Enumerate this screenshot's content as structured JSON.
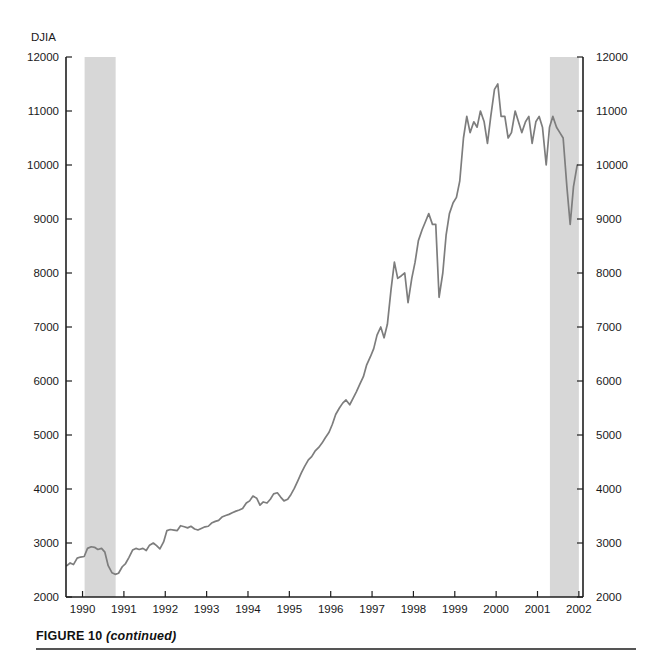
{
  "caption": {
    "label": "FIGURE 10",
    "note": "(continued)"
  },
  "chart_data": {
    "type": "line",
    "title": "",
    "subtitle": "",
    "xlabel": "",
    "ylabel": "DJIA",
    "ylabel_position": "top-left",
    "ylim": [
      2000,
      12000
    ],
    "xlim": [
      1989.6,
      2002.1
    ],
    "grid": false,
    "legend": null,
    "y_ticks": [
      2000,
      3000,
      4000,
      5000,
      6000,
      7000,
      8000,
      9000,
      10000,
      11000,
      12000
    ],
    "y_tick_labels": [
      "2000",
      "3000",
      "4000",
      "5000",
      "6000",
      "7000",
      "8000",
      "9000",
      "10000",
      "11000",
      "12000"
    ],
    "y_axis_right_ticks": [
      2000,
      3000,
      4000,
      5000,
      6000,
      7000,
      8000,
      9000,
      10000,
      11000,
      12000
    ],
    "y_axis_right_labels": [
      "2000",
      "3000",
      "4000",
      "5000",
      "6000",
      "7000",
      "8000",
      "9000",
      "10000",
      "11000",
      "12000"
    ],
    "x_ticks": [
      1990,
      1991,
      1992,
      1993,
      1994,
      1995,
      1996,
      1997,
      1998,
      1999,
      2000,
      2001,
      2002
    ],
    "x_tick_labels": [
      "1990",
      "1991",
      "1992",
      "1993",
      "1994",
      "1995",
      "1996",
      "1997",
      "1998",
      "1999",
      "2000",
      "2001",
      "2002"
    ],
    "line_color": "#7d7d7d",
    "band_color": "#d7d7d7",
    "axis_color": "#1f1f1f",
    "shaded_regions": [
      {
        "name": "recession-1990-1991",
        "start": 1990.05,
        "end": 1990.8
      },
      {
        "name": "recession-2001",
        "start": 2001.3,
        "end": 2002.0
      }
    ],
    "series": [
      {
        "name": "DJIA",
        "x": [
          1989.62,
          1989.7,
          1989.78,
          1989.87,
          1989.95,
          1990.04,
          1990.12,
          1990.21,
          1990.29,
          1990.37,
          1990.46,
          1990.54,
          1990.62,
          1990.71,
          1990.79,
          1990.87,
          1990.96,
          1991.04,
          1991.12,
          1991.21,
          1991.29,
          1991.37,
          1991.46,
          1991.54,
          1991.62,
          1991.71,
          1991.79,
          1991.87,
          1991.96,
          1992.04,
          1992.12,
          1992.21,
          1992.29,
          1992.37,
          1992.46,
          1992.54,
          1992.62,
          1992.71,
          1992.79,
          1992.87,
          1992.96,
          1993.04,
          1993.12,
          1993.21,
          1993.29,
          1993.37,
          1993.46,
          1993.54,
          1993.62,
          1993.71,
          1993.79,
          1993.87,
          1993.96,
          1994.04,
          1994.12,
          1994.21,
          1994.29,
          1994.37,
          1994.46,
          1994.54,
          1994.62,
          1994.71,
          1994.79,
          1994.87,
          1994.96,
          1995.04,
          1995.12,
          1995.21,
          1995.29,
          1995.37,
          1995.46,
          1995.54,
          1995.62,
          1995.71,
          1995.79,
          1995.87,
          1995.96,
          1996.04,
          1996.12,
          1996.21,
          1996.29,
          1996.37,
          1996.46,
          1996.54,
          1996.62,
          1996.71,
          1996.79,
          1996.87,
          1996.96,
          1997.04,
          1997.12,
          1997.21,
          1997.29,
          1997.37,
          1997.46,
          1997.54,
          1997.62,
          1997.71,
          1997.79,
          1997.87,
          1997.96,
          1998.04,
          1998.12,
          1998.21,
          1998.29,
          1998.37,
          1998.46,
          1998.54,
          1998.62,
          1998.71,
          1998.79,
          1998.87,
          1998.96,
          1999.04,
          1999.12,
          1999.21,
          1999.29,
          1999.37,
          1999.46,
          1999.54,
          1999.62,
          1999.71,
          1999.79,
          1999.87,
          1999.96,
          2000.04,
          2000.12,
          2000.21,
          2000.29,
          2000.37,
          2000.46,
          2000.54,
          2000.62,
          2000.71,
          2000.79,
          2000.87,
          2000.96,
          2001.04,
          2001.12,
          2001.21,
          2001.29,
          2001.37,
          2001.46,
          2001.54,
          2001.62,
          2001.71,
          2001.79,
          2001.87,
          2001.96
        ],
        "values": [
          2580,
          2630,
          2600,
          2720,
          2740,
          2750,
          2900,
          2930,
          2920,
          2880,
          2900,
          2830,
          2580,
          2450,
          2420,
          2440,
          2560,
          2620,
          2730,
          2870,
          2900,
          2880,
          2900,
          2860,
          2960,
          3000,
          2950,
          2890,
          3020,
          3230,
          3250,
          3240,
          3230,
          3320,
          3300,
          3280,
          3310,
          3260,
          3240,
          3270,
          3300,
          3310,
          3370,
          3400,
          3420,
          3480,
          3510,
          3530,
          3560,
          3590,
          3610,
          3640,
          3740,
          3780,
          3870,
          3830,
          3700,
          3760,
          3740,
          3810,
          3910,
          3930,
          3850,
          3780,
          3810,
          3900,
          4010,
          4160,
          4300,
          4420,
          4540,
          4600,
          4700,
          4770,
          4850,
          4950,
          5050,
          5200,
          5380,
          5500,
          5590,
          5650,
          5560,
          5680,
          5800,
          5950,
          6080,
          6300,
          6450,
          6600,
          6850,
          7000,
          6800,
          7050,
          7700,
          8200,
          7900,
          7950,
          8000,
          7450,
          7900,
          8200,
          8600,
          8800,
          8950,
          9100,
          8900,
          8900,
          7550,
          8000,
          8700,
          9100,
          9300,
          9400,
          9700,
          10500,
          10900,
          10600,
          10800,
          10700,
          11000,
          10800,
          10400,
          10900,
          11400,
          11500,
          10900,
          10900,
          10500,
          10600,
          11000,
          10800,
          10600,
          10800,
          10900,
          10400,
          10800,
          10900,
          10700,
          10000,
          10700,
          10900,
          10700,
          10600,
          10500,
          9600,
          8900,
          9600,
          10000
        ]
      }
    ]
  }
}
